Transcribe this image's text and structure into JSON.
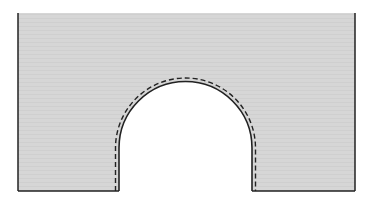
{
  "diagram": {
    "colors": {
      "fill": "#d4d4d4",
      "outline": "#222222",
      "dashed_line": "#222222",
      "background": "#ffffff"
    }
  }
}
